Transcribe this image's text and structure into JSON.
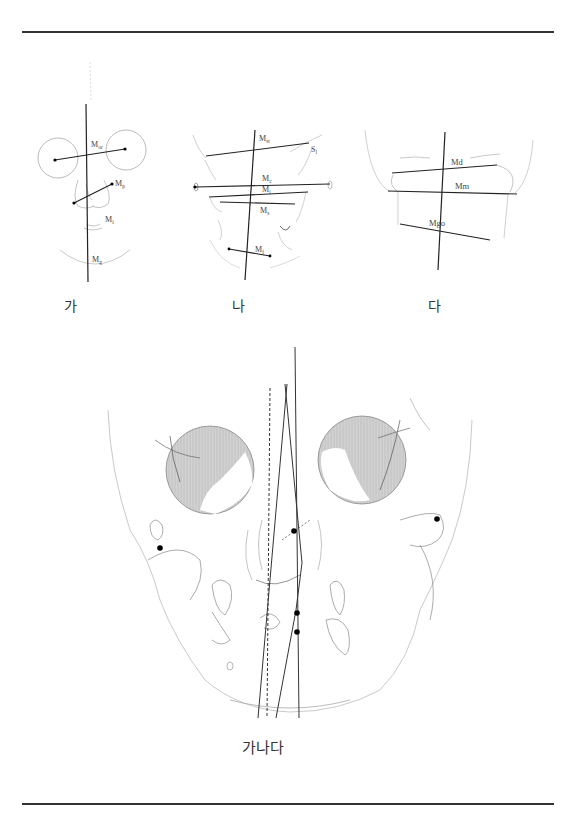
{
  "figure": {
    "panels": [
      {
        "id": "ga",
        "caption": "가",
        "labels": [
          {
            "base": "M",
            "sub": "or"
          },
          {
            "base": "M",
            "sub": "p"
          },
          {
            "base": "M",
            "sub": "i"
          },
          {
            "base": "M",
            "sub": "g"
          }
        ]
      },
      {
        "id": "na",
        "caption": "나",
        "labels": [
          {
            "base": "M",
            "sub": "st"
          },
          {
            "base": "S",
            "sub": "l"
          },
          {
            "base": "M",
            "sub": "c"
          },
          {
            "base": "M",
            "sub": "i"
          },
          {
            "base": "M",
            "sub": "s"
          },
          {
            "base": "M",
            "sub": "f"
          }
        ]
      },
      {
        "id": "da",
        "caption": "다",
        "labels": [
          {
            "base": "Md",
            "sub": ""
          },
          {
            "base": "Mm",
            "sub": ""
          },
          {
            "base": "Mgo",
            "sub": ""
          }
        ]
      }
    ],
    "combined": {
      "caption": "가나다",
      "line_styles": [
        "solid",
        "dashed",
        "solid",
        "solid"
      ]
    },
    "colors": {
      "rule": "#333333",
      "line": "#222222",
      "sketch": "#aaaaaa",
      "orbit_fill": "#c8c8c8",
      "landmark": "#000000"
    }
  }
}
